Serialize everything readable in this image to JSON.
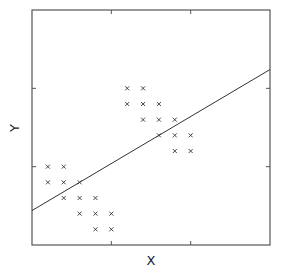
{
  "chart_data": {
    "type": "scatter",
    "title": "",
    "xlabel": "X",
    "ylabel": "Y",
    "xlim": [
      0,
      15
    ],
    "ylim": [
      0,
      15
    ],
    "x_ticks": [
      5,
      10
    ],
    "y_ticks": [
      5,
      10
    ],
    "x_tick_labels": [],
    "y_tick_labels": [],
    "grid": false,
    "legend": null,
    "marker": "x",
    "series": [
      {
        "name": "points",
        "points": [
          [
            1,
            5
          ],
          [
            2,
            5
          ],
          [
            1,
            4
          ],
          [
            2,
            4
          ],
          [
            3,
            4
          ],
          [
            2,
            3
          ],
          [
            3,
            3
          ],
          [
            4,
            3
          ],
          [
            3,
            2
          ],
          [
            4,
            2
          ],
          [
            5,
            2
          ],
          [
            4,
            1
          ],
          [
            5,
            1
          ],
          [
            6,
            10
          ],
          [
            7,
            10
          ],
          [
            6,
            9
          ],
          [
            7,
            9
          ],
          [
            8,
            9
          ],
          [
            7,
            8
          ],
          [
            8,
            8
          ],
          [
            9,
            8
          ],
          [
            8,
            7
          ],
          [
            9,
            7
          ],
          [
            10,
            7
          ],
          [
            9,
            6
          ],
          [
            10,
            6
          ]
        ]
      }
    ],
    "fit_line": {
      "name": "regression line",
      "x": [
        0,
        15
      ],
      "y": [
        2.2,
        11.2
      ],
      "slope": 0.6,
      "intercept": 2.2
    }
  },
  "labels": {
    "x": "X",
    "y": "Y"
  }
}
